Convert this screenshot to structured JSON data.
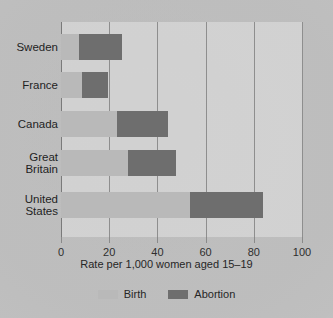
{
  "chart_data": {
    "type": "bar",
    "orientation": "horizontal",
    "stacked": true,
    "title": "",
    "xlabel": "Rate per 1,000 women aged 15–19",
    "ylabel": "",
    "xlim": [
      0,
      100
    ],
    "xticks": [
      0,
      20,
      40,
      60,
      80,
      100
    ],
    "xtick_labels": [
      "0",
      "20",
      "40",
      "60",
      "80",
      "100"
    ],
    "grid": true,
    "legend_position": "bottom",
    "categories": [
      "Sweden",
      "France",
      "Canada",
      "Great\nBritain",
      "United\nStates"
    ],
    "series": [
      {
        "name": "Birth",
        "color": "#b9b9b9",
        "values": [
          7.5,
          8.7,
          23.2,
          27.8,
          53.5
        ]
      },
      {
        "name": "Abortion",
        "color": "#6e6e6e",
        "values": [
          17.8,
          10.8,
          21.2,
          20.0,
          30.3
        ]
      }
    ],
    "totals": [
      25.3,
      19.5,
      44.4,
      47.8,
      83.8
    ]
  },
  "axis": {
    "title": "Rate per 1,000 women aged 15–19",
    "ticks": [
      {
        "label": "0",
        "value": 0
      },
      {
        "label": "20",
        "value": 20
      },
      {
        "label": "40",
        "value": 40
      },
      {
        "label": "60",
        "value": 60
      },
      {
        "label": "80",
        "value": 80
      },
      {
        "label": "100",
        "value": 100
      }
    ]
  },
  "categories": [
    {
      "label": "Sweden"
    },
    {
      "label": "France"
    },
    {
      "label": "Canada"
    },
    {
      "label": "Great\nBritain"
    },
    {
      "label": "United\nStates"
    }
  ],
  "legend": [
    {
      "label": "Birth",
      "color": "#b9b9b9"
    },
    {
      "label": "Abortion",
      "color": "#6e6e6e"
    }
  ],
  "colors": {
    "birth": "#b9b9b9",
    "abortion": "#6e6e6e",
    "gridline": "#8e8e8e",
    "text": "#1f1f1f",
    "page": "#bdbdbd"
  }
}
